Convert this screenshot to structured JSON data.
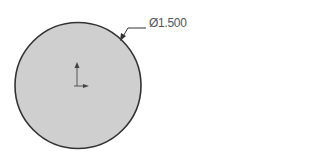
{
  "sketch": {
    "shape": "circle",
    "fill_color": "#cfcfcf",
    "stroke_color": "#333333",
    "dimension": {
      "symbol": "Ø",
      "value": "1.500",
      "label": "Ø1.500"
    },
    "origin_marker": "origin-axes-icon"
  }
}
